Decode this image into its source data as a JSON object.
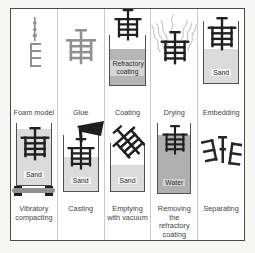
{
  "figure": {
    "type": "process-diagram",
    "steps": [
      {
        "label": "Foam model",
        "icon": "foam-model-icon"
      },
      {
        "label": "Glue",
        "icon": "glue-cluster-icon"
      },
      {
        "label": "Coating",
        "icon": "coating-cluster-icon",
        "container": "Refractory coating"
      },
      {
        "label": "Drying",
        "icon": "drying-vapor-icon"
      },
      {
        "label": "Embedding",
        "icon": "embedding-cluster-icon",
        "container": "Sand"
      },
      {
        "label": "Vibratory compacting",
        "icon": "vibrating-table-icon",
        "container": "Sand"
      },
      {
        "label": "Casting",
        "icon": "casting-ladle-icon",
        "container": "Sand"
      },
      {
        "label": "Emptying with vacuum",
        "icon": "tilted-cluster-icon",
        "container": "Sand"
      },
      {
        "label": "Removing the refractory coating",
        "icon": "water-bath-icon",
        "container": "Water"
      },
      {
        "label": "Separating",
        "icon": "separated-parts-icon"
      }
    ],
    "colors": {
      "frame_border": "#4a4a4a",
      "cell_divider": "#c9c9c9",
      "cluster_black": "#1f1f1f",
      "foam_gray": "#8f8f8f",
      "sand_fill": "#dbdbdb",
      "refractory_coating_fill": "#b5b5b5",
      "water_fill": "#afafaf",
      "vibrating_table_gray": "#919191"
    }
  }
}
